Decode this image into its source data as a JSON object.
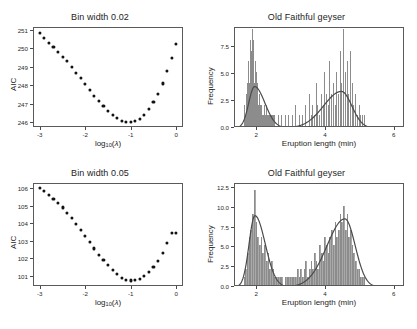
{
  "figure": {
    "layout": "2x2 grid of plots",
    "background": "#ffffff",
    "dot_color": "#121212",
    "bar_color": "#a9a9a9",
    "curve_color": "#4a4a4a",
    "frame_color": "#5a5a5a"
  },
  "chart_data": [
    {
      "id": "aic-bw-002",
      "type": "scatter",
      "title": "Bin width 0.02",
      "xlabel": "log10(lambda)",
      "ylabel": "AIC",
      "xlim": [
        -3.15,
        0.15
      ],
      "ylim": [
        245.75,
        251.15
      ],
      "xticks": [
        -3,
        -2,
        -1,
        0
      ],
      "xticklabels": [
        "-3",
        "-2",
        "-1",
        "0"
      ],
      "yticks": [
        246,
        247,
        248,
        249,
        250,
        251
      ],
      "yticklabels": [
        "246",
        "247",
        "248",
        "249",
        "250",
        "251"
      ],
      "grid": false,
      "legend": "none",
      "x": [
        -3.0,
        -2.9,
        -2.8,
        -2.7,
        -2.6,
        -2.5,
        -2.4,
        -2.3,
        -2.2,
        -2.1,
        -2.0,
        -1.9,
        -1.8,
        -1.7,
        -1.6,
        -1.5,
        -1.4,
        -1.3,
        -1.2,
        -1.1,
        -1.0,
        -0.9,
        -0.8,
        -0.7,
        -0.6,
        -0.5,
        -0.4,
        -0.3,
        -0.2,
        -0.1,
        0.0
      ],
      "y": [
        250.82,
        250.55,
        250.3,
        250.07,
        249.82,
        249.55,
        249.3,
        249.0,
        248.68,
        248.38,
        248.08,
        247.76,
        247.45,
        247.18,
        246.9,
        246.64,
        246.42,
        246.22,
        246.08,
        246.0,
        246.0,
        246.06,
        246.2,
        246.42,
        246.72,
        247.1,
        247.55,
        248.1,
        248.78,
        249.5,
        250.22
      ]
    },
    {
      "id": "geyser-bw-002",
      "type": "bar",
      "title": "Old Faithful geyser",
      "xlabel": "Eruption length (min)",
      "ylabel": "Frequency",
      "xlim": [
        1.35,
        6.3
      ],
      "ylim": [
        0,
        9.3
      ],
      "xticks": [
        2,
        4,
        6
      ],
      "xticklabels": [
        "2",
        "4",
        "6"
      ],
      "yticks": [
        0.0,
        2.5,
        5.0,
        7.5
      ],
      "yticklabels": [
        "0.0",
        "2.5",
        "5.0",
        "7.5"
      ],
      "grid": false,
      "legend": "none",
      "bin_width": 0.02,
      "bin_starts": [
        1.6,
        1.62,
        1.64,
        1.66,
        1.68,
        1.7,
        1.72,
        1.74,
        1.76,
        1.78,
        1.8,
        1.82,
        1.84,
        1.86,
        1.88,
        1.9,
        1.92,
        1.94,
        1.96,
        1.98,
        2.0,
        2.02,
        2.04,
        2.06,
        2.08,
        2.1,
        2.12,
        2.14,
        2.16,
        2.18,
        2.2,
        2.22,
        2.24,
        2.26,
        2.28,
        2.3,
        2.32,
        2.34,
        2.36,
        2.38,
        2.4,
        2.42,
        2.44,
        2.46,
        2.48,
        2.5,
        2.6,
        2.7,
        2.8,
        2.9,
        3.0,
        3.1,
        3.2,
        3.3,
        3.4,
        3.5,
        3.55,
        3.6,
        3.65,
        3.7,
        3.75,
        3.8,
        3.85,
        3.9,
        3.95,
        4.0,
        4.05,
        4.1,
        4.15,
        4.2,
        4.25,
        4.3,
        4.35,
        4.4,
        4.45,
        4.5,
        4.55,
        4.6,
        4.65,
        4.7,
        4.75,
        4.8,
        4.85,
        4.9,
        4.95,
        5.0,
        5.05,
        5.1
      ],
      "bin_counts": [
        1,
        2,
        1,
        3,
        2,
        4,
        3,
        6,
        4,
        8,
        5,
        7,
        9,
        6,
        8,
        4,
        6,
        3,
        5,
        2,
        4,
        2,
        3,
        1,
        2,
        1,
        2,
        1,
        1,
        2,
        1,
        1,
        2,
        1,
        1,
        1,
        1,
        1,
        1,
        1,
        1,
        1,
        1,
        1,
        1,
        1,
        1,
        1,
        1,
        1,
        1,
        2,
        1,
        1,
        2,
        3,
        1,
        2,
        1,
        4,
        2,
        1,
        3,
        2,
        5,
        3,
        2,
        6,
        3,
        4,
        2,
        5,
        3,
        7,
        4,
        9,
        5,
        6,
        3,
        7,
        4,
        2,
        3,
        1,
        2,
        1,
        1,
        1
      ],
      "density_curve": {
        "description": "bimodal kernel density scaled to frequency",
        "peaks": [
          {
            "x": 1.92,
            "y": 3.85
          },
          {
            "x": 4.45,
            "y": 3.4
          }
        ],
        "valley": {
          "x": 3.0,
          "y": 0.28
        }
      }
    },
    {
      "id": "aic-bw-005",
      "type": "scatter",
      "title": "Bin width 0.05",
      "xlabel": "log10(lambda)",
      "ylabel": "AIC",
      "xlim": [
        -3.15,
        0.15
      ],
      "ylim": [
        100.4,
        106.3
      ],
      "xticks": [
        -3,
        -2,
        -1,
        0
      ],
      "xticklabels": [
        "-3",
        "-2",
        "-1",
        "0"
      ],
      "yticks": [
        101,
        102,
        103,
        104,
        105,
        106
      ],
      "yticklabels": [
        "101",
        "102",
        "103",
        "104",
        "105",
        "106"
      ],
      "grid": false,
      "legend": "none",
      "x": [
        -3.0,
        -2.9,
        -2.8,
        -2.7,
        -2.6,
        -2.5,
        -2.4,
        -2.3,
        -2.2,
        -2.1,
        -2.0,
        -1.9,
        -1.8,
        -1.7,
        -1.6,
        -1.5,
        -1.4,
        -1.3,
        -1.2,
        -1.1,
        -1.0,
        -0.9,
        -0.8,
        -0.7,
        -0.6,
        -0.5,
        -0.4,
        -0.3,
        -0.2,
        -0.1,
        0.0
      ],
      "y": [
        106.0,
        105.82,
        105.6,
        105.4,
        105.15,
        104.9,
        104.6,
        104.3,
        103.98,
        103.62,
        103.28,
        102.9,
        102.55,
        102.2,
        101.88,
        101.58,
        101.3,
        101.08,
        100.88,
        100.76,
        100.72,
        100.74,
        100.82,
        100.98,
        101.2,
        101.5,
        101.85,
        102.3,
        102.85,
        103.45,
        103.45
      ]
    },
    {
      "id": "geyser-bw-005",
      "type": "bar",
      "title": "Old Faithful geyser",
      "xlabel": "Eruption length (min)",
      "ylabel": "Frequency",
      "xlim": [
        1.35,
        6.3
      ],
      "ylim": [
        0,
        13.0
      ],
      "xticks": [
        2,
        4,
        6
      ],
      "xticklabels": [
        "2",
        "4",
        "6"
      ],
      "yticks": [
        0.0,
        2.5,
        5.0,
        7.5,
        10.0,
        12.5
      ],
      "yticklabels": [
        "0.0",
        "2.5",
        "5.0",
        "7.5",
        "10.0",
        "12.5"
      ],
      "grid": false,
      "legend": "none",
      "bin_width": 0.05,
      "bin_starts": [
        1.6,
        1.65,
        1.7,
        1.75,
        1.8,
        1.85,
        1.9,
        1.95,
        2.0,
        2.05,
        2.1,
        2.15,
        2.2,
        2.25,
        2.3,
        2.35,
        2.4,
        2.45,
        2.5,
        2.55,
        2.6,
        2.65,
        2.7,
        2.75,
        2.8,
        2.85,
        2.9,
        2.95,
        3.0,
        3.05,
        3.1,
        3.15,
        3.2,
        3.25,
        3.3,
        3.35,
        3.4,
        3.45,
        3.5,
        3.55,
        3.6,
        3.65,
        3.7,
        3.75,
        3.8,
        3.85,
        3.9,
        3.95,
        4.0,
        4.05,
        4.1,
        4.15,
        4.2,
        4.25,
        4.3,
        4.35,
        4.4,
        4.45,
        4.5,
        4.55,
        4.6,
        4.65,
        4.7,
        4.75,
        4.8,
        4.85,
        4.9,
        4.95,
        5.0,
        5.05,
        5.1
      ],
      "bin_counts": [
        1,
        2,
        4,
        6,
        7,
        9,
        12,
        8,
        6,
        5,
        6,
        4,
        5,
        3,
        4,
        2,
        3,
        2,
        1,
        1,
        1,
        1,
        1,
        0,
        1,
        1,
        1,
        1,
        1,
        1,
        1,
        2,
        1,
        2,
        1,
        2,
        3,
        1,
        2,
        3,
        2,
        4,
        3,
        2,
        5,
        4,
        3,
        6,
        5,
        4,
        6,
        7,
        5,
        8,
        6,
        7,
        9,
        8,
        10,
        7,
        9,
        6,
        7,
        5,
        4,
        3,
        2,
        2,
        1,
        1,
        1
      ],
      "density_curve": {
        "description": "bimodal kernel density scaled to frequency",
        "peaks": [
          {
            "x": 1.93,
            "y": 9.0
          },
          {
            "x": 4.55,
            "y": 8.6
          }
        ],
        "valley": {
          "x": 3.0,
          "y": 0.45
        }
      }
    }
  ]
}
